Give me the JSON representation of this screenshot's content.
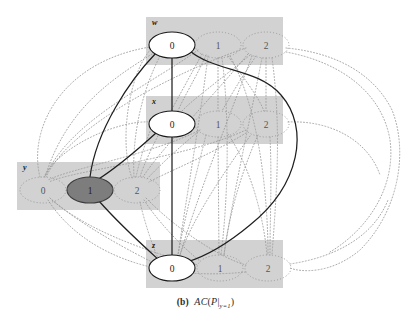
{
  "figure": {
    "caption_label": "(b)",
    "caption_expr_ac": "AC",
    "caption_expr_open": "(",
    "caption_expr_p": "P",
    "caption_expr_bar": "|",
    "caption_expr_sub": "y=1",
    "caption_expr_close": ")",
    "caption_full": "(b) AC(P|y=1)"
  },
  "colors": {
    "group_box": "#d2d2d2",
    "node_fill_light": "#ffffff",
    "node_fill_dark": "#7d7d7d",
    "node_stroke": "#1a1a1a",
    "solid_edge": "#1f1f1f",
    "dotted_edge": "#9a9a9a",
    "background": "#ffffff",
    "text": "#1a1a1a"
  },
  "groups": [
    {
      "id": "w",
      "label": "w",
      "box": {
        "x": 146,
        "y": 17,
        "w": 137,
        "h": 48
      },
      "label_pos": {
        "x": 152,
        "y": 25
      },
      "nodes": [
        {
          "id": "w0",
          "value": "0",
          "cx": 172,
          "cy": 45,
          "rx": 23,
          "ry": 13,
          "state": "selected",
          "style": "solid"
        },
        {
          "id": "w1",
          "value": "1",
          "cx": 218,
          "cy": 45,
          "rx": 23,
          "ry": 13,
          "state": "pruned",
          "style": "dotted"
        },
        {
          "id": "w2",
          "value": "2",
          "cx": 266,
          "cy": 45,
          "rx": 23,
          "ry": 13,
          "state": "pruned",
          "style": "dotted"
        }
      ]
    },
    {
      "id": "x",
      "label": "x",
      "box": {
        "x": 146,
        "y": 96,
        "w": 137,
        "h": 48
      },
      "label_pos": {
        "x": 152,
        "y": 104
      },
      "nodes": [
        {
          "id": "x0",
          "value": "0",
          "cx": 172,
          "cy": 124,
          "rx": 23,
          "ry": 13,
          "state": "selected",
          "style": "solid"
        },
        {
          "id": "x1",
          "value": "1",
          "cx": 218,
          "cy": 124,
          "rx": 23,
          "ry": 13,
          "state": "pruned",
          "style": "dotted"
        },
        {
          "id": "x2",
          "value": "2",
          "cx": 266,
          "cy": 124,
          "rx": 23,
          "ry": 13,
          "state": "pruned",
          "style": "dotted"
        }
      ]
    },
    {
      "id": "y",
      "label": "y",
      "box": {
        "x": 17,
        "y": 162,
        "w": 143,
        "h": 48
      },
      "label_pos": {
        "x": 23,
        "y": 170
      },
      "nodes": [
        {
          "id": "y0",
          "value": "0",
          "cx": 43,
          "cy": 190,
          "rx": 23,
          "ry": 13,
          "state": "pruned",
          "style": "dotted"
        },
        {
          "id": "y1",
          "value": "1",
          "cx": 90,
          "cy": 190,
          "rx": 23,
          "ry": 13,
          "state": "assigned",
          "style": "filled"
        },
        {
          "id": "y2",
          "value": "2",
          "cx": 137,
          "cy": 190,
          "rx": 23,
          "ry": 13,
          "state": "pruned",
          "style": "dotted"
        }
      ]
    },
    {
      "id": "z",
      "label": "z",
      "box": {
        "x": 146,
        "y": 240,
        "w": 137,
        "h": 48
      },
      "label_pos": {
        "x": 152,
        "y": 248
      },
      "nodes": [
        {
          "id": "z0",
          "value": "0",
          "cx": 172,
          "cy": 268,
          "rx": 23,
          "ry": 13,
          "state": "selected",
          "style": "solid"
        },
        {
          "id": "z1",
          "value": "1",
          "cx": 220,
          "cy": 268,
          "rx": 23,
          "ry": 13,
          "state": "pruned",
          "style": "dotted"
        },
        {
          "id": "z2",
          "value": "2",
          "cx": 268,
          "cy": 268,
          "rx": 23,
          "ry": 13,
          "state": "pruned",
          "style": "dotted"
        }
      ]
    }
  ],
  "solid_edges": [
    {
      "from": "w0",
      "to": "x0",
      "path": "M172,58 L172,111"
    },
    {
      "from": "w0",
      "to": "y1",
      "path": "M156,53 C130,80 96,130 90,177"
    },
    {
      "from": "x0",
      "to": "y1",
      "path": "M156,133 C135,152 110,172 97,180"
    },
    {
      "from": "x0",
      "to": "z0",
      "path": "M172,137 L172,255"
    },
    {
      "from": "y1",
      "to": "z0",
      "path": "M99,201 C120,225 148,250 160,261"
    },
    {
      "from": "w0",
      "to": "z0",
      "path": "M190,51 C215,72 258,68 281,95 C310,128 300,185 250,225 C220,250 200,258 187,262"
    }
  ],
  "dotted_edges": [
    {
      "from": "w0",
      "to": "y0",
      "path": "M152,54 C110,80 66,110 45,177"
    },
    {
      "from": "w0",
      "to": "y2",
      "path": "M160,56 C140,95 132,140 134,177"
    },
    {
      "from": "w1",
      "to": "x1",
      "path": "M218,58 L218,111"
    },
    {
      "from": "w1",
      "to": "x2",
      "path": "M228,56 C245,80 258,96 264,111"
    },
    {
      "from": "w1",
      "to": "x0",
      "path": "M206,55 C196,78 182,100 178,111"
    },
    {
      "from": "w2",
      "to": "x2",
      "path": "M266,58 L266,111"
    },
    {
      "from": "w2",
      "to": "x1",
      "path": "M256,56 C240,80 228,100 222,111"
    },
    {
      "from": "w2",
      "to": "x0",
      "path": "M250,55 C220,80 192,100 182,111"
    },
    {
      "from": "w1",
      "to": "y0",
      "path": "M198,50 C150,85 70,120 45,177"
    },
    {
      "from": "w1",
      "to": "y2",
      "path": "M202,54 C180,95 148,150 140,177"
    },
    {
      "from": "w2",
      "to": "y0",
      "path": "M246,48 C180,70 70,125 46,177"
    },
    {
      "from": "w2",
      "to": "y2",
      "path": "M248,54 C210,100 160,150 143,177"
    },
    {
      "from": "w1",
      "to": "z1",
      "path": "M222,58 C230,120 228,200 221,255"
    },
    {
      "from": "w1",
      "to": "z2",
      "path": "M230,56 C260,110 268,200 268,255"
    },
    {
      "from": "w2",
      "to": "z1",
      "path": "M262,58 C250,120 232,200 224,255"
    },
    {
      "from": "w2",
      "to": "z2",
      "path": "M272,58 C282,130 276,200 272,255"
    },
    {
      "from": "w1",
      "to": "z0",
      "path": "M208,56 C200,120 186,200 178,255"
    },
    {
      "from": "w2",
      "to": "z0",
      "path": "M252,56 C228,120 196,200 180,255"
    },
    {
      "from": "x1",
      "to": "y0",
      "path": "M200,130 C150,155 72,168 48,180"
    },
    {
      "from": "x1",
      "to": "y2",
      "path": "M198,132 C178,148 155,170 146,180"
    },
    {
      "from": "x2",
      "to": "y0",
      "path": "M246,130 C180,160 74,170 49,182"
    },
    {
      "from": "x2",
      "to": "y2",
      "path": "M246,133 C210,155 165,173 149,182"
    },
    {
      "from": "x1",
      "to": "z1",
      "path": "M218,137 L219,255"
    },
    {
      "from": "x1",
      "to": "z2",
      "path": "M228,134 C252,170 264,220 267,255"
    },
    {
      "from": "x2",
      "to": "z1",
      "path": "M258,135 C240,175 228,220 224,255"
    },
    {
      "from": "x2",
      "to": "z2",
      "path": "M270,137 C272,180 270,220 270,255"
    },
    {
      "from": "x1",
      "to": "z0",
      "path": "M206,135 C196,175 184,220 178,255"
    },
    {
      "from": "x2",
      "to": "z0",
      "path": "M250,136 C222,175 192,220 180,255"
    },
    {
      "from": "y0",
      "to": "z1",
      "path": "M50,198 C90,235 170,258 198,265"
    },
    {
      "from": "y0",
      "to": "z2",
      "path": "M48,200 C80,250 150,282 246,272"
    },
    {
      "from": "y2",
      "to": "z1",
      "path": "M144,200 C160,225 188,252 200,261"
    },
    {
      "from": "y2",
      "to": "z2",
      "path": "M146,198 C175,228 220,258 246,265"
    },
    {
      "from": "y0",
      "to": "z0",
      "path": "M52,200 C85,228 138,255 152,262"
    },
    {
      "from": "y2",
      "to": "z0",
      "path": "M140,202 C144,220 152,245 158,258"
    },
    {
      "from": "y0",
      "to": "x0",
      "path": "M44,177 C60,145 120,120 150,122"
    },
    {
      "from": "y2",
      "to": "x0",
      "path": "M136,177 C140,158 148,135 152,127"
    },
    {
      "from": "y0",
      "to": "w0",
      "path": "M40,177 C28,130 60,62 150,47"
    },
    {
      "from": "y2",
      "to": "w0",
      "path": "M132,178 C118,140 130,70 152,48"
    },
    {
      "from": "w2",
      "to": "out_right_1",
      "path": "M286,48 C330,52 372,70 392,110 C408,150 400,210 360,250 C330,275 300,272 290,268"
    },
    {
      "from": "w2",
      "to": "out_right_2",
      "path": "M286,52 C340,62 382,92 390,140 C396,185 370,228 330,252"
    },
    {
      "from": "z2",
      "to": "out_right_3",
      "path": "M290,264 C330,258 372,240 388,200"
    },
    {
      "from": "x2",
      "to": "out_right_4",
      "path": "M288,122 C330,120 368,140 380,175"
    }
  ],
  "legend": {
    "note_selected": "solid white ellipse = value kept by arc consistency",
    "note_assigned": "dark filled ellipse = assigned value y=1",
    "note_pruned": "dotted ellipse = value pruned"
  }
}
